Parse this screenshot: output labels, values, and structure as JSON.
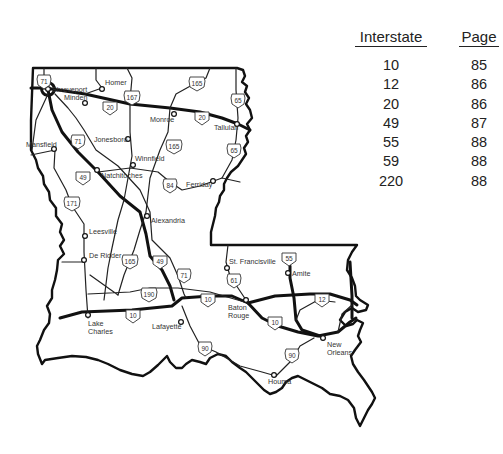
{
  "legend": {
    "headers": {
      "interstate": "Interstate",
      "page": "Page"
    },
    "rows": [
      {
        "interstate": "10",
        "page": "85"
      },
      {
        "interstate": "12",
        "page": "86"
      },
      {
        "interstate": "20",
        "page": "86"
      },
      {
        "interstate": "49",
        "page": "87"
      },
      {
        "interstate": "55",
        "page": "88"
      },
      {
        "interstate": "59",
        "page": "88"
      },
      {
        "interstate": "220",
        "page": "88"
      }
    ]
  },
  "map": {
    "state": "Louisiana",
    "cities": [
      {
        "name": "Shreveport"
      },
      {
        "name": "Minden"
      },
      {
        "name": "Homer"
      },
      {
        "name": "Monroe"
      },
      {
        "name": "Tallulah"
      },
      {
        "name": "Mansfield"
      },
      {
        "name": "Jonesboro"
      },
      {
        "name": "Winnfield"
      },
      {
        "name": "Natchitoches"
      },
      {
        "name": "Ferriday"
      },
      {
        "name": "Alexandria"
      },
      {
        "name": "Leesville"
      },
      {
        "name": "De Ridder"
      },
      {
        "name": "St. Francisville"
      },
      {
        "name": "Amite"
      },
      {
        "name": "Baton Rouge"
      },
      {
        "name": "Lake Charles"
      },
      {
        "name": "Lafayette"
      },
      {
        "name": "New Orleans"
      },
      {
        "name": "Houma"
      }
    ],
    "shields": {
      "us71_north": "71",
      "us167": "167",
      "i20_west": "20",
      "us165_north": "165",
      "us65_north": "65",
      "i20_east": "20",
      "us71_mid": "71",
      "us165_mid": "165",
      "us65_mid": "65",
      "i49_north": "49",
      "us171": "171",
      "us84": "84",
      "us165_south": "165",
      "i49_south": "49",
      "us71_south": "71",
      "us190": "190",
      "i55": "55",
      "us61": "61",
      "i10_mid": "10",
      "i12": "12",
      "i10_west": "10",
      "i10_east": "10",
      "us90_west": "90",
      "us90_east": "90"
    }
  }
}
